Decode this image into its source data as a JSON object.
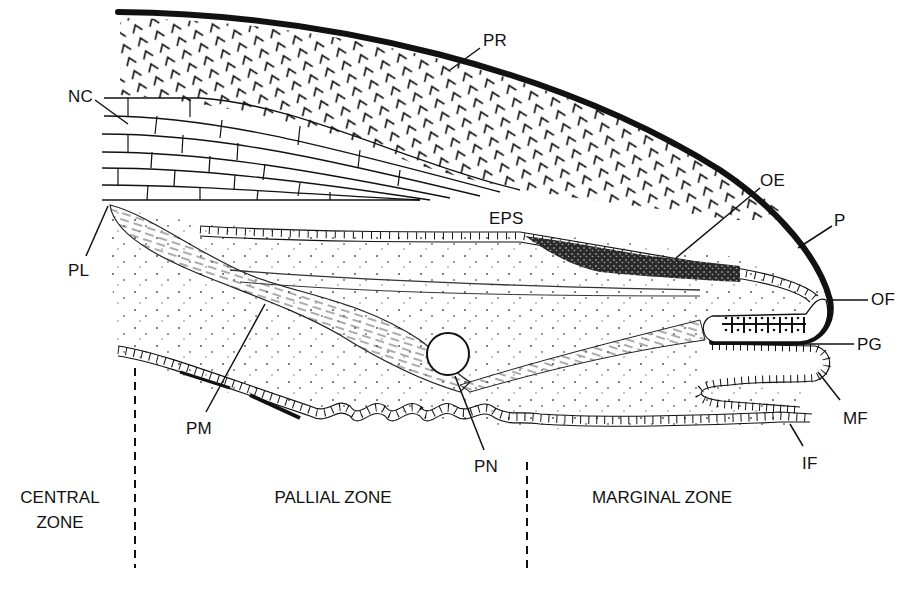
{
  "figure": {
    "type": "anatomical-cross-section",
    "colors": {
      "ink": "#111111",
      "background": "#ffffff",
      "stipple": "#555555",
      "dark_tissue": "#2a2a2a"
    }
  },
  "labels": [
    {
      "id": "NC",
      "text": "NC",
      "x": 68,
      "y": 96
    },
    {
      "id": "PR",
      "text": "PR",
      "x": 483,
      "y": 40
    },
    {
      "id": "OE",
      "text": "OE",
      "x": 760,
      "y": 172
    },
    {
      "id": "EPS",
      "text": "EPS",
      "x": 489,
      "y": 212
    },
    {
      "id": "P",
      "text": "P",
      "x": 836,
      "y": 218
    },
    {
      "id": "PL",
      "text": "PL",
      "x": 68,
      "y": 264
    },
    {
      "id": "OF",
      "text": "OF",
      "x": 871,
      "y": 290
    },
    {
      "id": "PG",
      "text": "PG",
      "x": 857,
      "y": 334
    },
    {
      "id": "MF",
      "text": "MF",
      "x": 843,
      "y": 410
    },
    {
      "id": "PM",
      "text": "PM",
      "x": 186,
      "y": 422
    },
    {
      "id": "IF",
      "text": "IF",
      "x": 802,
      "y": 456
    },
    {
      "id": "PN",
      "text": "PN",
      "x": 474,
      "y": 458
    }
  ],
  "zones": [
    {
      "id": "central",
      "text": "CENTRAL\nZONE",
      "x": 12,
      "y": 485,
      "w": 96
    },
    {
      "id": "pallial",
      "text": "PALLIAL ZONE",
      "x": 258,
      "y": 485,
      "w": 150
    },
    {
      "id": "marginal",
      "text": "MARGINAL ZONE",
      "x": 582,
      "y": 485,
      "w": 160
    }
  ],
  "zone_dividers": [
    {
      "x": 135,
      "y1": 368,
      "y2": 568
    },
    {
      "x": 527,
      "y1": 462,
      "y2": 568
    }
  ],
  "legend_terms": {
    "NC": "nacre",
    "PR": "prismatic layer",
    "P": "periostracum",
    "OE": "outer epithelium",
    "EPS": "extrapallial space",
    "PL": "pallial line",
    "OF": "outer fold",
    "PG": "periostracal groove",
    "MF": "middle fold",
    "IF": "inner fold",
    "PM": "pallial muscle",
    "PN": "pallial nerve"
  }
}
